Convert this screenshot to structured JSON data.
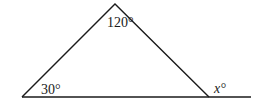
{
  "figure": {
    "type": "triangle-exterior-angle",
    "labels": {
      "apex_angle": "120°",
      "left_angle": "30°",
      "exterior_angle": "x°"
    },
    "colors": {
      "stroke": "#1a1a1a",
      "background": "#ffffff"
    }
  }
}
